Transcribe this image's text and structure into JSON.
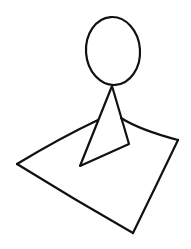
{
  "drawing": {
    "description": "Hand-drawn stick figure with round head and triangular body sitting on a tilted square",
    "colors": {
      "background": "#ffffff",
      "stroke": "#111111"
    },
    "head": {
      "cx": 113,
      "cy": 51,
      "rx": 27,
      "ry": 34
    },
    "body_triangle": {
      "apex": [
        112,
        86
      ],
      "bottom_left": [
        80,
        166
      ],
      "right": [
        129,
        144
      ]
    },
    "ground_square": {
      "left": [
        17,
        164
      ],
      "bottom": [
        133,
        233
      ],
      "right": [
        178,
        140
      ],
      "top_left_join": [
        98,
        120
      ],
      "top_right_join": [
        121,
        118
      ]
    }
  }
}
